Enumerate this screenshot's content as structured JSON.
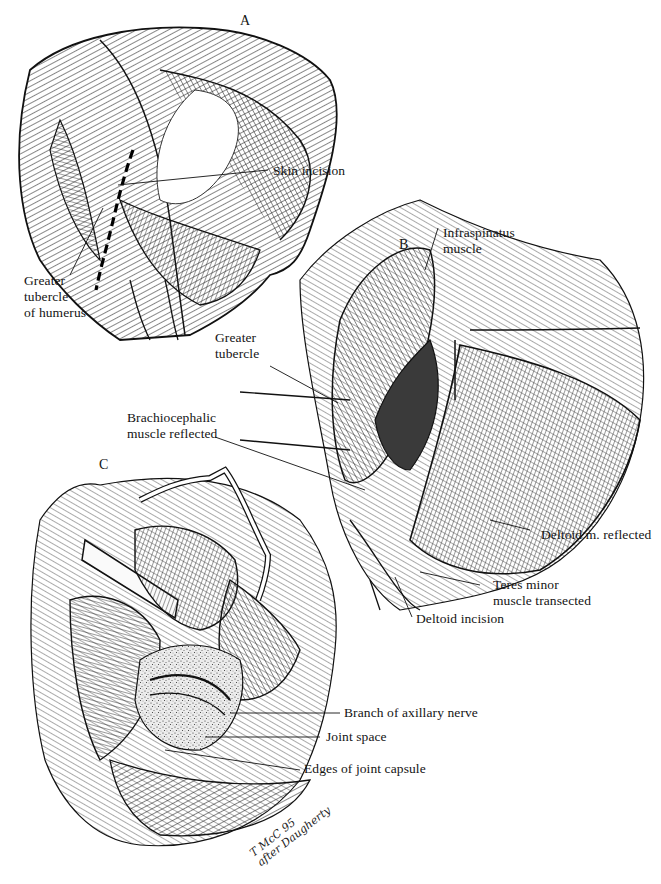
{
  "figure": {
    "panels": [
      {
        "id": "A",
        "letter": "A",
        "labels": {
          "skin_incision": "Skin incision",
          "greater_tubercle_line1": "Greater",
          "greater_tubercle_line2": "tubercle",
          "greater_tubercle_line3": "of humerus"
        }
      },
      {
        "id": "B",
        "letter": "B",
        "labels": {
          "infraspinatus_line1": "Infraspinatus",
          "infraspinatus_line2": "muscle",
          "greater_tubercle_line1": "Greater",
          "greater_tubercle_line2": "tubercle",
          "brachiocephalic_line1": "Brachiocephalic",
          "brachiocephalic_line2": "muscle reflected",
          "deltoid_reflected": "Deltoid m. reflected",
          "teres_minor_line1": "Teres minor",
          "teres_minor_line2": "muscle transected",
          "deltoid_incision": "Deltoid incision"
        }
      },
      {
        "id": "C",
        "letter": "C",
        "labels": {
          "axillary_nerve": "Branch of axillary nerve",
          "joint_space": "Joint space",
          "joint_capsule": "Edges of joint capsule"
        }
      }
    ],
    "signature": {
      "line1": "T McC 95",
      "line2": "after Daugherty"
    },
    "colors": {
      "ink": "#141414",
      "paper": "#ffffff"
    }
  }
}
